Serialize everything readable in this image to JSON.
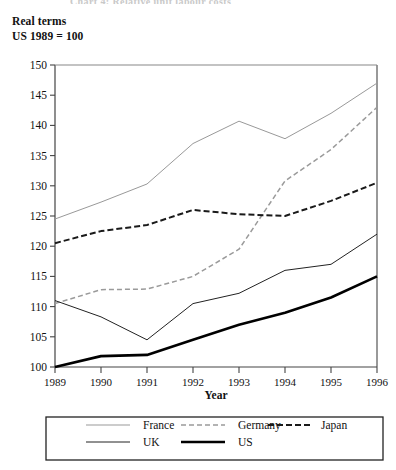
{
  "figure": {
    "cut_title": "Chart 4: Relative unit labour costs",
    "note_line1": "Real terms",
    "note_line2": "US 1989 = 100"
  },
  "chart_data": {
    "type": "line",
    "title": "",
    "subtitle": "Real terms  US 1989 = 100",
    "xlabel": "Year",
    "ylabel": "",
    "x": [
      1989,
      1990,
      1991,
      1992,
      1993,
      1994,
      1995,
      1996
    ],
    "categories": [
      "1989",
      "1990",
      "1991",
      "1992",
      "1993",
      "1994",
      "1995",
      "1996"
    ],
    "xlim": [
      1989,
      1996
    ],
    "ylim": [
      100,
      150
    ],
    "ytick_values": [
      100,
      105,
      110,
      115,
      120,
      125,
      130,
      135,
      140,
      145,
      150
    ],
    "ytick_labels": [
      "100",
      "105",
      "110",
      "115",
      "120",
      "125",
      "130",
      "135",
      "140",
      "145",
      "150"
    ],
    "grid": false,
    "legend_position": "bottom",
    "series": [
      {
        "name": "France",
        "values": [
          124.5,
          127.3,
          130.3,
          137.0,
          140.7,
          137.8,
          142.0,
          147.0
        ],
        "style": "solid-light",
        "color": "#999999",
        "width": 1.0,
        "dash": "none"
      },
      {
        "name": "Germany",
        "values": [
          110.5,
          112.8,
          112.9,
          115.0,
          119.5,
          130.8,
          136.0,
          143.0
        ],
        "style": "dashed-light",
        "color": "#9a9a9a",
        "width": 1.5,
        "dash": "5,3"
      },
      {
        "name": "Japan",
        "values": [
          120.5,
          122.5,
          123.5,
          126.0,
          125.3,
          125.0,
          127.5,
          130.5
        ],
        "style": "dashed-dark",
        "color": "#1a1a1a",
        "width": 2.0,
        "dash": "6,3"
      },
      {
        "name": "UK",
        "values": [
          111.0,
          108.3,
          104.5,
          110.5,
          112.2,
          116.0,
          117.0,
          122.0
        ],
        "style": "solid-thin",
        "color": "#222222",
        "width": 1.0,
        "dash": "none"
      },
      {
        "name": "US",
        "values": [
          100.0,
          101.8,
          102.0,
          104.5,
          107.0,
          109.0,
          111.5,
          115.0
        ],
        "style": "solid-thick",
        "color": "#000000",
        "width": 2.6,
        "dash": "none"
      }
    ]
  },
  "legend": {
    "entries": [
      {
        "label": "France"
      },
      {
        "label": "Germany"
      },
      {
        "label": "Japan"
      },
      {
        "label": "UK"
      },
      {
        "label": "US"
      }
    ]
  }
}
